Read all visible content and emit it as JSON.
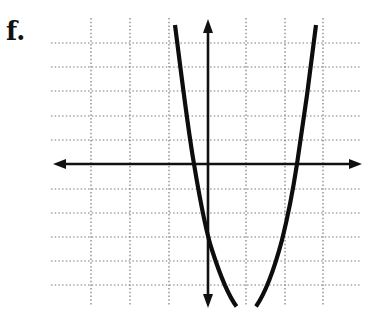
{
  "problem_label": "f.",
  "colors": {
    "background": "#ffffff",
    "ink": "#111111",
    "grid": "#888888"
  },
  "graph": {
    "type": "coordinate-plane-parabola",
    "grid": {
      "x_gridlines": [
        -4,
        -3,
        -2,
        -1,
        0,
        1,
        2,
        3
      ],
      "y_gridlines": [
        5,
        4,
        3,
        2,
        1,
        0,
        -1,
        -2,
        -3,
        -4,
        -5
      ],
      "style": "dotted"
    },
    "axes": {
      "x_axis": {
        "arrows": "both"
      },
      "y_axis": {
        "arrows": "both"
      }
    },
    "curve": {
      "shape": "upward-opening parabola",
      "vertex_x": 1,
      "y_intercept": -3,
      "x_intercepts_approx": [
        -0.35,
        2.3
      ],
      "vertex_below_visible_area": true
    }
  }
}
